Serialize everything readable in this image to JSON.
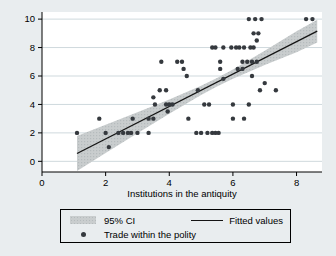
{
  "figure": {
    "xlabel": "Institutions in the antiquity",
    "colors": {
      "canvas_bg": "#e9edef",
      "plot_bg": "#ffffff",
      "gridline": "#cfd9dd",
      "axis": "#000000",
      "band_fill": "#c9cdce",
      "band_dot": "#b5bbbd",
      "fit_line": "#141414",
      "marker": "#35393e",
      "text": "#000000"
    }
  },
  "chart_data": {
    "type": "scatter",
    "title": "",
    "xlabel": "Institutions in the antiquity",
    "ylabel": "",
    "xlim": [
      0,
      8.8
    ],
    "ylim": [
      -0.75,
      10.5
    ],
    "x_ticks": [
      0,
      2,
      4,
      6,
      8
    ],
    "y_ticks": [
      0,
      2,
      4,
      6,
      8,
      10
    ],
    "grid": "horizontal-only",
    "legend_position": "bottom",
    "series": [
      {
        "name": "95% CI",
        "type": "band",
        "points_x_lower_upper": [
          [
            1.1,
            -0.68,
            1.78
          ],
          [
            2.0,
            0.58,
            2.57
          ],
          [
            3.0,
            1.98,
            3.45
          ],
          [
            4.0,
            3.35,
            4.35
          ],
          [
            5.0,
            4.66,
            5.32
          ],
          [
            5.5,
            5.26,
            5.86
          ],
          [
            6.0,
            5.8,
            6.46
          ],
          [
            7.0,
            6.77,
            7.77
          ],
          [
            8.0,
            7.67,
            9.15
          ],
          [
            8.65,
            8.35,
            9.95
          ]
        ]
      },
      {
        "name": "Fitted values",
        "type": "line",
        "points": [
          [
            1.1,
            0.55
          ],
          [
            8.65,
            9.15
          ]
        ]
      },
      {
        "name": "Trade within the polity",
        "type": "scatter",
        "points": [
          [
            1.1,
            2
          ],
          [
            1.8,
            3
          ],
          [
            2.0,
            2
          ],
          [
            2.1,
            1
          ],
          [
            2.4,
            2
          ],
          [
            2.55,
            2
          ],
          [
            2.7,
            2
          ],
          [
            2.8,
            2
          ],
          [
            2.85,
            3
          ],
          [
            3.0,
            2
          ],
          [
            3.35,
            2
          ],
          [
            3.35,
            3
          ],
          [
            3.5,
            3
          ],
          [
            3.5,
            4.5
          ],
          [
            3.55,
            4
          ],
          [
            3.7,
            5
          ],
          [
            3.75,
            7
          ],
          [
            3.9,
            4
          ],
          [
            3.9,
            5
          ],
          [
            3.95,
            3.5
          ],
          [
            4.0,
            4
          ],
          [
            4.1,
            4
          ],
          [
            4.25,
            7
          ],
          [
            4.4,
            7
          ],
          [
            4.45,
            6.5
          ],
          [
            4.55,
            6
          ],
          [
            4.6,
            3
          ],
          [
            4.85,
            2
          ],
          [
            4.9,
            5
          ],
          [
            5.0,
            2
          ],
          [
            5.1,
            4
          ],
          [
            5.2,
            2
          ],
          [
            5.25,
            4
          ],
          [
            5.35,
            2
          ],
          [
            5.35,
            8
          ],
          [
            5.45,
            2
          ],
          [
            5.45,
            8
          ],
          [
            5.55,
            2
          ],
          [
            5.6,
            6.5
          ],
          [
            5.6,
            7
          ],
          [
            5.7,
            5.8
          ],
          [
            5.7,
            8
          ],
          [
            5.95,
            8
          ],
          [
            6.0,
            3
          ],
          [
            6.0,
            4
          ],
          [
            6.1,
            8
          ],
          [
            6.15,
            6.5
          ],
          [
            6.2,
            8
          ],
          [
            6.3,
            6.5
          ],
          [
            6.3,
            7
          ],
          [
            6.35,
            3
          ],
          [
            6.35,
            8
          ],
          [
            6.45,
            7
          ],
          [
            6.5,
            4
          ],
          [
            6.5,
            10
          ],
          [
            6.55,
            8
          ],
          [
            6.6,
            6
          ],
          [
            6.6,
            7
          ],
          [
            6.65,
            8
          ],
          [
            6.65,
            9
          ],
          [
            6.7,
            10
          ],
          [
            6.75,
            7
          ],
          [
            6.75,
            8.5
          ],
          [
            6.8,
            9
          ],
          [
            6.85,
            5
          ],
          [
            6.9,
            10
          ],
          [
            7.0,
            5.5
          ],
          [
            7.35,
            5
          ],
          [
            8.3,
            10
          ],
          [
            8.5,
            10
          ]
        ]
      }
    ]
  }
}
